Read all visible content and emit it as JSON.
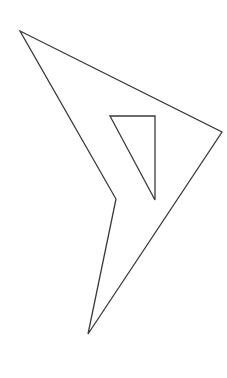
{
  "canvas": {
    "width": 227,
    "height": 378,
    "background_color": "#ffffff",
    "description": "line-art-polygon-with-triangular-hole"
  },
  "style": {
    "stroke_color": "#3a3a3a",
    "stroke_width": 1.3,
    "fill": "none",
    "fill_color": "none",
    "linejoin": "miter",
    "linecap": "butt"
  },
  "shapes": {
    "outer_polygon": {
      "name": "concave-arrow-quadrilateral",
      "closed": true,
      "points": [
        {
          "label": "top-left-apex",
          "x": 20,
          "y": 31
        },
        {
          "label": "right-vertex",
          "x": 222,
          "y": 132
        },
        {
          "label": "bottom-tip",
          "x": 88,
          "y": 334
        },
        {
          "label": "inner-notch",
          "x": 116,
          "y": 199
        }
      ],
      "path": "M 20 31 L 222 132 L 88 334 L 116 199 Z"
    },
    "inner_triangle": {
      "name": "triangular-hole",
      "closed": true,
      "points": [
        {
          "label": "top-left",
          "x": 110,
          "y": 116
        },
        {
          "label": "top-right",
          "x": 155,
          "y": 116
        },
        {
          "label": "bottom-right",
          "x": 155,
          "y": 200
        }
      ],
      "path": "M 110 116 L 155 116 L 155 200 Z"
    }
  }
}
